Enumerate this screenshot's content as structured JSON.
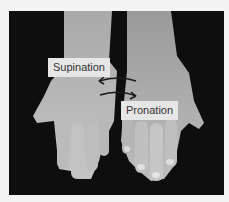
{
  "figure": {
    "labels": {
      "supination": "Supination",
      "pronation": "Pronation"
    },
    "icons": {
      "upper_arrow": "arrow-left",
      "lower_arrow": "arrow-right"
    }
  }
}
